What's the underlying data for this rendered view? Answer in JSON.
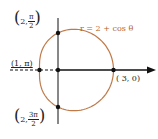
{
  "equation": "r = 2 + cos θ",
  "colors": {
    "curve": "#c07a4a",
    "axis": "#111111",
    "label": "#b5652b"
  },
  "points": {
    "top": {
      "prefix": "2,",
      "num": "π",
      "den": "2",
      "r": 2,
      "theta_deg": 90
    },
    "left": {
      "label": "(1, π)",
      "r": 1,
      "theta_deg": 180
    },
    "right": {
      "label": "( 3, 0)",
      "r": 3,
      "theta_deg": 0
    },
    "bottom": {
      "prefix": "2,",
      "num": "3π",
      "den": "2",
      "r": 2,
      "theta_deg": 270
    }
  },
  "chart_data": {
    "type": "line",
    "title": "r = 2 + cos θ",
    "coordinate_system": "polar",
    "function": "r = 2 + cos(theta)",
    "theta_range": [
      0,
      6.2832
    ],
    "labeled_points": [
      {
        "label": "(3, 0)",
        "r": 3,
        "theta": "0"
      },
      {
        "label": "(2, π/2)",
        "r": 2,
        "theta": "π/2"
      },
      {
        "label": "(1, π)",
        "r": 1,
        "theta": "π"
      },
      {
        "label": "(2, 3π/2)",
        "r": 2,
        "theta": "3π/2"
      }
    ],
    "origin_px": [
      58,
      70
    ],
    "scale_px_per_unit": 18.5
  }
}
